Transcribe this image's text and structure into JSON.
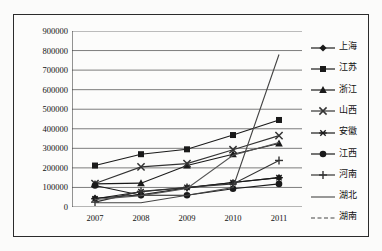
{
  "chart_data": {
    "type": "line",
    "title": "",
    "xlabel": "",
    "ylabel": "",
    "categories": [
      "2007",
      "2008",
      "2009",
      "2010",
      "2011"
    ],
    "ylim": [
      0,
      900000
    ],
    "ytick_labels": [
      "0",
      "100000",
      "200000",
      "300000",
      "400000",
      "500000",
      "600000",
      "700000",
      "800000",
      "900000"
    ],
    "ytick_values": [
      0,
      100000,
      200000,
      300000,
      400000,
      500000,
      600000,
      700000,
      800000,
      900000
    ],
    "grid": true,
    "legend_position": "right",
    "series": [
      {
        "name": "上海",
        "marker": "diamond",
        "color": "#1a1a1a",
        "values": [
          45000,
          62000,
          98000,
          125000,
          150000
        ]
      },
      {
        "name": "江苏",
        "marker": "square",
        "color": "#1a1a1a",
        "values": [
          212000,
          270000,
          295000,
          368000,
          445000
        ]
      },
      {
        "name": "浙江",
        "marker": "triangle",
        "color": "#1a1a1a",
        "values": [
          118000,
          122000,
          212000,
          270000,
          325000
        ]
      },
      {
        "name": "山西",
        "marker": "x",
        "color": "#333333",
        "values": [
          120000,
          205000,
          222000,
          293000,
          365000
        ]
      },
      {
        "name": "安徽",
        "marker": "asterisk",
        "color": "#1a1a1a",
        "values": [
          42000,
          78000,
          100000,
          125000,
          150000
        ]
      },
      {
        "name": "江西",
        "marker": "circle",
        "color": "#1a1a1a",
        "values": [
          110000,
          60000,
          60000,
          93000,
          118000
        ]
      },
      {
        "name": "河南",
        "marker": "plus",
        "color": "#333333",
        "values": [
          25000,
          80000,
          100000,
          118000,
          238000
        ]
      },
      {
        "name": "湖北",
        "marker": "none",
        "color": "#555555",
        "values": [
          38000,
          58000,
          95000,
          265000,
          330000
        ]
      },
      {
        "name": "湖南",
        "marker": "none-dashed",
        "color": "#444444",
        "values": [
          22000,
          22000,
          60000,
          100000,
          780000
        ]
      }
    ]
  },
  "legend": {
    "items": [
      {
        "label": "上海",
        "marker": "diamond-marker"
      },
      {
        "label": "江苏",
        "marker": "square-marker"
      },
      {
        "label": "浙江",
        "marker": "triangle-marker"
      },
      {
        "label": "山西",
        "marker": "x-marker"
      },
      {
        "label": "安徽",
        "marker": "asterisk-marker"
      },
      {
        "label": "江西",
        "marker": "circle-marker"
      },
      {
        "label": "河南",
        "marker": "plus-marker"
      },
      {
        "label": "湖北",
        "marker": "line-marker"
      },
      {
        "label": "湖南",
        "marker": "dashed-line-marker"
      }
    ]
  },
  "colors": {
    "frame_border": "#2b2b2b",
    "plot_background": "#fcfcfb",
    "grid_line": "#6e6e6e",
    "axis_line": "#3a3a3a",
    "text": "#111111"
  }
}
